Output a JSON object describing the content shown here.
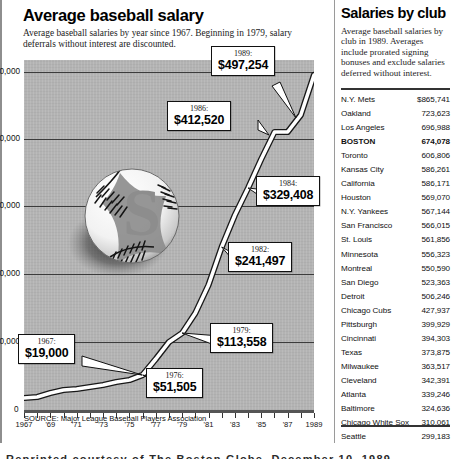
{
  "chart_panel": {
    "title": "Average baseball salary",
    "subtitle": "Average baseball salaries by year since 1967.  Beginning in 1979, salary deferrals without interest are discounted.",
    "source": "SOURCE: Major League Baseball Players Association"
  },
  "sidebar": {
    "title": "Salaries by club",
    "intro": "Average baseball salaries by club in 1989. Averages include prorated signing bonuses and exclude salaries deferred without interest.",
    "rows": [
      {
        "club": "N.Y. Mets",
        "amount": "$865,741",
        "highlight": false
      },
      {
        "club": "Oakland",
        "amount": "723,623",
        "highlight": false
      },
      {
        "club": "Los Angeles",
        "amount": "696,988",
        "highlight": false
      },
      {
        "club": "BOSTON",
        "amount": "674,078",
        "highlight": true
      },
      {
        "club": "Toronto",
        "amount": "606,806",
        "highlight": false
      },
      {
        "club": "Kansas City",
        "amount": "586,261",
        "highlight": false
      },
      {
        "club": "California",
        "amount": "586,171",
        "highlight": false
      },
      {
        "club": "Houston",
        "amount": "569,070",
        "highlight": false
      },
      {
        "club": "N.Y. Yankees",
        "amount": "567,144",
        "highlight": false
      },
      {
        "club": "San Francisco",
        "amount": "566,015",
        "highlight": false
      },
      {
        "club": "St. Louis",
        "amount": "561,856",
        "highlight": false
      },
      {
        "club": "Minnesota",
        "amount": "556,323",
        "highlight": false
      },
      {
        "club": "Montreal",
        "amount": "550,590",
        "highlight": false
      },
      {
        "club": "San Diego",
        "amount": "523,363",
        "highlight": false
      },
      {
        "club": "Detroit",
        "amount": "506,246",
        "highlight": false
      },
      {
        "club": "Chicago Cubs",
        "amount": "427,937",
        "highlight": false
      },
      {
        "club": "Pittsburgh",
        "amount": "399,929",
        "highlight": false
      },
      {
        "club": "Cincinnati",
        "amount": "394,303",
        "highlight": false
      },
      {
        "club": "Texas",
        "amount": "373,875",
        "highlight": false
      },
      {
        "club": "Milwaukee",
        "amount": "363,517",
        "highlight": false
      },
      {
        "club": "Cleveland",
        "amount": "342,391",
        "highlight": false
      },
      {
        "club": "Atlanta",
        "amount": "339,246",
        "highlight": false
      },
      {
        "club": "Baltimore",
        "amount": "324,636",
        "highlight": false
      },
      {
        "club": "Chicago White Sox",
        "amount": "310,061",
        "highlight": false
      },
      {
        "club": "Seattle",
        "amount": "299,183",
        "highlight": false
      },
      {
        "club": "Philadelphia",
        "amount": "298,552",
        "highlight": false
      }
    ]
  },
  "caption": {
    "text": "Reprinted courtesy of The Boston Globe, December 10, 1989"
  },
  "chart_data": {
    "type": "line",
    "title": "Average baseball salary",
    "xlabel": "",
    "ylabel": "",
    "xlim": [
      1967,
      1989
    ],
    "ylim": [
      0,
      530000
    ],
    "grid": true,
    "legend": null,
    "y_ticks": [
      0,
      100000,
      200000,
      300000,
      400000,
      500000
    ],
    "y_tick_labels": [
      "0",
      "100,000",
      "200,000",
      "300,000",
      "400,000",
      "$500,000"
    ],
    "x_ticks": [
      1967,
      1968,
      1969,
      1970,
      1971,
      1972,
      1973,
      1974,
      1975,
      1976,
      1977,
      1978,
      1979,
      1980,
      1981,
      1982,
      1983,
      1984,
      1985,
      1986,
      1987,
      1988,
      1989
    ],
    "x_tick_labels": [
      "1967",
      "",
      "'69",
      "",
      "'71",
      "",
      "'73",
      "",
      "'75",
      "",
      "'77",
      "",
      "'79",
      "",
      "'81",
      "",
      "'83",
      "",
      "'85",
      "",
      "'87",
      "",
      "1989"
    ],
    "series": [
      {
        "name": "Average salary",
        "x": [
          1967,
          1968,
          1969,
          1970,
          1971,
          1972,
          1973,
          1974,
          1975,
          1976,
          1977,
          1978,
          1979,
          1980,
          1981,
          1982,
          1983,
          1984,
          1985,
          1986,
          1987,
          1988,
          1989
        ],
        "values": [
          19000,
          20500,
          24909,
          29303,
          31543,
          34092,
          36566,
          40839,
          44676,
          51505,
          76066,
          99876,
          113558,
          143756,
          185651,
          241497,
          289194,
          329408,
          371571,
          412520,
          412454,
          438729,
          497254
        ]
      }
    ],
    "annotations": [
      {
        "year": "1967:",
        "value": "$19,000"
      },
      {
        "year": "1976:",
        "value": "$51,505"
      },
      {
        "year": "1979:",
        "value": "$113,558"
      },
      {
        "year": "1982:",
        "value": "$241,497"
      },
      {
        "year": "1984:",
        "value": "$329,408"
      },
      {
        "year": "1986:",
        "value": "$412,520"
      },
      {
        "year": "1989:",
        "value": "$497,254"
      }
    ],
    "decoration": "baseball-with-dollar-sign"
  }
}
